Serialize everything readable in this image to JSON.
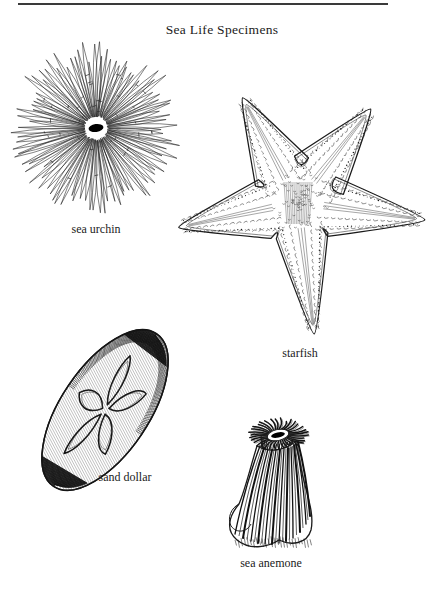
{
  "document": {
    "title": "Sea Life Specimens",
    "background_color": "#ffffff",
    "ink_color": "#1a1a1a",
    "rule_color": "#3a3a3a",
    "page_width": 444,
    "page_height": 592
  },
  "rule": {
    "name": "top-horizontal-rule",
    "x": 18,
    "y": 3,
    "width": 370,
    "height": 2
  },
  "figures": [
    {
      "id": "sea-urchin",
      "caption": "sea urchin",
      "icon": "sea-urchin-illustration",
      "center_x": 96,
      "center_y": 128,
      "caption_x": 96,
      "caption_y": 222,
      "spine_count": 96,
      "radius_outer": 72,
      "mouth_color": "#000000"
    },
    {
      "id": "starfish",
      "caption": "starfish",
      "icon": "starfish-illustration",
      "center_x": 300,
      "center_y": 205,
      "caption_x": 300,
      "caption_y": 352,
      "arm_count": 5,
      "arm_length": 140
    },
    {
      "id": "sand-dollar",
      "caption": "sand dollar",
      "icon": "sand-dollar-illustration",
      "center_x": 105,
      "center_y": 410,
      "caption_x": 125,
      "caption_y": 475,
      "rotation_deg": -56,
      "radius_major": 92,
      "radius_minor": 44,
      "petal_count": 5
    },
    {
      "id": "sea-anemone",
      "caption": "sea anemone",
      "icon": "sea-anemone-illustration",
      "center_x": 272,
      "center_y": 500,
      "caption_x": 266,
      "caption_y": 560,
      "tentacle_count": 34,
      "stripe_count": 23,
      "mouth_color": "#000000"
    }
  ]
}
